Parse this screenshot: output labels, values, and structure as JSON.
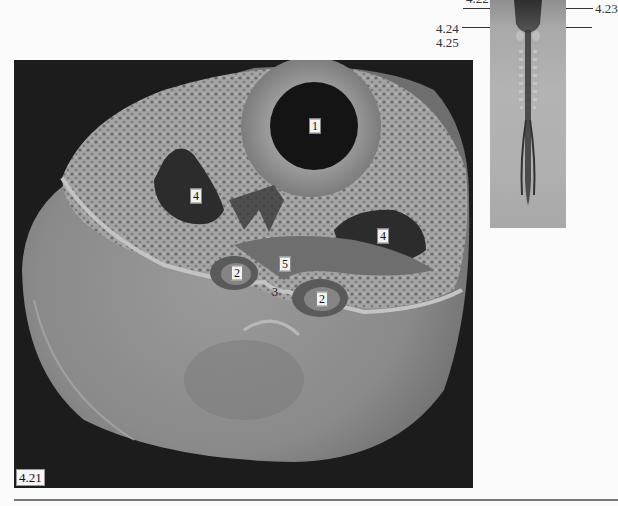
{
  "figure": {
    "main_panel_label": "4.21",
    "structure_labels": [
      {
        "id": "1",
        "x": 301,
        "y": 66
      },
      {
        "id": "4",
        "x": 182,
        "y": 136
      },
      {
        "id": "4",
        "x": 369,
        "y": 176
      },
      {
        "id": "2",
        "x": 223,
        "y": 213
      },
      {
        "id": "5",
        "x": 271,
        "y": 204
      },
      {
        "id": "3",
        "x": 261,
        "y": 232
      },
      {
        "id": "2",
        "x": 308,
        "y": 239
      }
    ]
  },
  "embryo_panel": {
    "section_labels": {
      "top_cut": "4.22",
      "right": "4.23",
      "left_a": "4.24",
      "left_b": "4.25"
    }
  },
  "colors": {
    "sem_background": "#1c1c1c",
    "tissue_light": "#a9a9a9",
    "tissue_mid": "#8a8a8a",
    "cavity_dark": "#2a2a2a",
    "page": "#fbfbfb"
  }
}
